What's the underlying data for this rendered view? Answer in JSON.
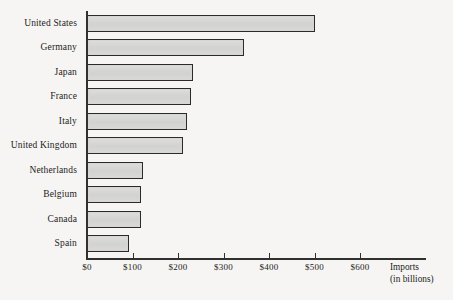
{
  "chart_data": {
    "type": "bar",
    "orientation": "horizontal",
    "title": "",
    "subtitle": "",
    "xlabel": "Imports",
    "xlabel_sub": "(in billions)",
    "ylabel": "",
    "categories": [
      "United States",
      "Germany",
      "Japan",
      "France",
      "Italy",
      "United Kingdom",
      "Netherlands",
      "Belgium",
      "Canada",
      "Spain"
    ],
    "values": [
      500,
      345,
      232,
      228,
      220,
      212,
      124,
      119,
      119,
      92
    ],
    "value_prefix": "$",
    "units": "billions",
    "xlim": [
      0,
      700
    ],
    "xticks": [
      0,
      100,
      200,
      300,
      400,
      500,
      600
    ],
    "xticklabels": [
      "$0",
      "$100",
      "$200",
      "$300",
      "$400",
      "$500",
      "$600"
    ],
    "grid": false,
    "legend": false,
    "bar_fill_color": "#d6d6d4",
    "bar_border_color": "#2b2b29",
    "background_color": "#f6f5f3",
    "axis_color": "#30302e"
  },
  "axis": {
    "title_line1": "Imports",
    "title_line2": "(in billions)"
  }
}
